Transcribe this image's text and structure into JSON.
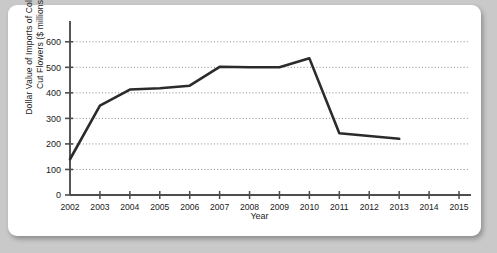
{
  "chart_data": {
    "type": "line",
    "title": "",
    "xlabel": "Year",
    "ylabel": "Dollar Value of Imports of Colombian Cut Flowers ($ millions)",
    "ylabel_line1": "Dollar Value of Imports of Colombian",
    "ylabel_line2": "Cut Flowers ($ millions)",
    "x": [
      2002,
      2003,
      2004,
      2005,
      2006,
      2007,
      2008,
      2009,
      2010,
      2011,
      2012,
      2013
    ],
    "values": [
      140,
      350,
      413,
      418,
      428,
      502,
      500,
      500,
      535,
      242,
      231,
      220
    ],
    "xtick_labels": [
      "2002",
      "2003",
      "2004",
      "2005",
      "2006",
      "2007",
      "2008",
      "2009",
      "2010",
      "2011",
      "2012",
      "2013",
      "2014",
      "2015"
    ],
    "xticks": [
      2002,
      2003,
      2004,
      2005,
      2006,
      2007,
      2008,
      2009,
      2010,
      2011,
      2012,
      2013,
      2014,
      2015
    ],
    "ytick_labels": [
      "0",
      "100",
      "200",
      "300",
      "400",
      "500",
      "600"
    ],
    "yticks": [
      0,
      100,
      200,
      300,
      400,
      500,
      600
    ],
    "xlim": [
      2002,
      2015.4
    ],
    "ylim": [
      0,
      650
    ],
    "grid": "horizontal-dotted",
    "legend": "none",
    "series_color": "#2b2b2b",
    "axis_color": "#4d4d4d",
    "grid_color": "#7a7a7a",
    "background": "#ffffff",
    "page_background": "#c9c9c9"
  }
}
